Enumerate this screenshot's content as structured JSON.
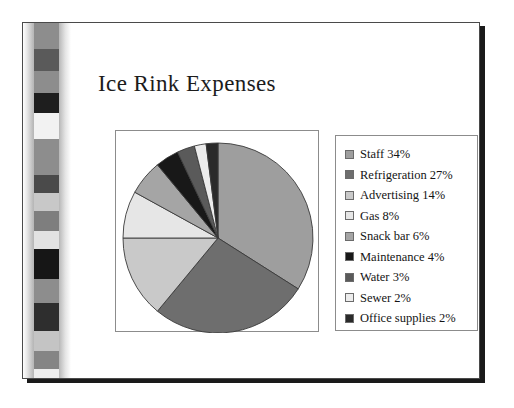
{
  "slide": {
    "title": "Ice Rink Expenses",
    "background_color": "#ffffff",
    "frame_color": "#1a1a1a"
  },
  "decoration": {
    "name": "vertical-photo-band",
    "band_gradient_from": "#ffffff",
    "band_gradient_mid": "#8e8e8e",
    "blocks": [
      {
        "top": 0,
        "height": 26,
        "color": "#8d8d8d"
      },
      {
        "top": 26,
        "height": 22,
        "color": "#5a5a5a"
      },
      {
        "top": 48,
        "height": 22,
        "color": "#8d8d8d"
      },
      {
        "top": 70,
        "height": 20,
        "color": "#1e1e1e"
      },
      {
        "top": 90,
        "height": 26,
        "color": "#f2f2f2"
      },
      {
        "top": 116,
        "height": 36,
        "color": "#8d8d8d"
      },
      {
        "top": 152,
        "height": 18,
        "color": "#4a4a4a"
      },
      {
        "top": 170,
        "height": 18,
        "color": "#c8c8c8"
      },
      {
        "top": 188,
        "height": 20,
        "color": "#7e7e7e"
      },
      {
        "top": 208,
        "height": 18,
        "color": "#e2e2e2"
      },
      {
        "top": 226,
        "height": 30,
        "color": "#161616"
      },
      {
        "top": 256,
        "height": 24,
        "color": "#8d8d8d"
      },
      {
        "top": 280,
        "height": 28,
        "color": "#2e2e2e"
      },
      {
        "top": 308,
        "height": 20,
        "color": "#c4c4c4"
      },
      {
        "top": 328,
        "height": 18,
        "color": "#858585"
      },
      {
        "top": 346,
        "height": 14,
        "color": "#ededed"
      },
      {
        "top": 360,
        "height": 24,
        "color": "#2a2a2a"
      },
      {
        "top": 384,
        "height": 18,
        "color": "#8d8d8d"
      },
      {
        "top": 402,
        "height": 22,
        "color": "#1a1a1a"
      }
    ]
  },
  "chart_data": {
    "type": "pie",
    "title": "Ice Rink Expenses",
    "xlabel": "",
    "ylabel": "",
    "legend_position": "right",
    "grid": false,
    "start_angle_deg": 0,
    "direction": "clockwise",
    "categories": [
      "Staff",
      "Refrigeration",
      "Advertising",
      "Gas",
      "Snack bar",
      "Maintenance",
      "Water",
      "Sewer",
      "Office supplies"
    ],
    "values": [
      34,
      27,
      14,
      8,
      6,
      4,
      3,
      2,
      2
    ],
    "unit": "%",
    "colors": [
      "#9e9e9e",
      "#6e6e6e",
      "#c9c9c9",
      "#e6e6e6",
      "#a5a5a5",
      "#181818",
      "#5a5a5a",
      "#ececec",
      "#2a2a2a"
    ],
    "slice_edge_color": "#3a3a3a"
  },
  "legend": {
    "items": [
      {
        "label": "Staff 34%",
        "color": "#9e9e9e"
      },
      {
        "label": "Refrigeration 27%",
        "color": "#6e6e6e"
      },
      {
        "label": "Advertising 14%",
        "color": "#c9c9c9"
      },
      {
        "label": "Gas 8%",
        "color": "#e6e6e6"
      },
      {
        "label": "Snack bar 6%",
        "color": "#a5a5a5"
      },
      {
        "label": "Maintenance 4%",
        "color": "#181818"
      },
      {
        "label": "Water 3%",
        "color": "#5a5a5a"
      },
      {
        "label": "Sewer 2%",
        "color": "#ececec"
      },
      {
        "label": "Office supplies 2%",
        "color": "#2a2a2a"
      }
    ]
  }
}
